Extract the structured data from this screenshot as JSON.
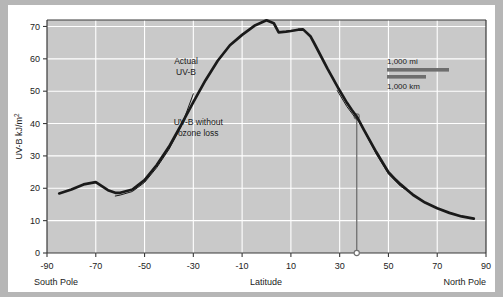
{
  "chart_data": {
    "type": "line",
    "title": "",
    "xlabel": "Latitude",
    "ylabel": "UV-B kJ/m2",
    "ylabel_display": "UV-B kJ/m",
    "ylabel_superscript": "2",
    "xlim": [
      -90,
      90
    ],
    "ylim": [
      0,
      72
    ],
    "grid": true,
    "legend_position": "none",
    "xticks": [
      -90,
      -70,
      -50,
      -30,
      -10,
      10,
      30,
      50,
      70,
      90
    ],
    "xtick_labels": [
      "-90",
      "-70",
      "-50",
      "-30",
      "-10",
      "10",
      "30",
      "50",
      "70",
      "90"
    ],
    "yticks": [
      0,
      10,
      20,
      30,
      40,
      50,
      60,
      70
    ],
    "ytick_labels": [
      "0",
      "10",
      "20",
      "30",
      "40",
      "50",
      "60",
      "70"
    ],
    "axis_end_labels": {
      "left": "South Pole",
      "right": "North Pole"
    },
    "series": [
      {
        "name": "Actual UV-B",
        "style": "thick-dark",
        "color": "#1a1a1a",
        "x": [
          -85,
          -80,
          -75,
          -70,
          -65,
          -62,
          -60,
          -55,
          -50,
          -45,
          -40,
          -35,
          -30,
          -25,
          -20,
          -15,
          -10,
          -5,
          0,
          3,
          5,
          8,
          10,
          13,
          15,
          18,
          20,
          25,
          30,
          33,
          35,
          37,
          40,
          45,
          50,
          53,
          55,
          60,
          65,
          70,
          75,
          80,
          85
        ],
        "y": [
          18.4,
          19.6,
          21.2,
          21.9,
          19.4,
          18.6,
          18.6,
          19.6,
          22.5,
          27.2,
          32.8,
          39.6,
          46.6,
          53.4,
          59.4,
          64.2,
          67.4,
          70.2,
          71.9,
          71.0,
          68.2,
          68.4,
          68.6,
          69.0,
          69.1,
          67.0,
          64.2,
          57.0,
          50.2,
          46.4,
          44.2,
          42.2,
          38.0,
          31.2,
          25.0,
          22.6,
          21.2,
          18.0,
          15.6,
          13.8,
          12.4,
          11.3,
          10.6
        ]
      },
      {
        "name": "UV-B without ozone loss",
        "style": "thin-dark",
        "color": "#1a1a1a",
        "x": [
          -62,
          -60,
          -55,
          -50,
          -45,
          -40,
          -35,
          -30
        ],
        "y": [
          17.6,
          17.9,
          19.0,
          21.8,
          26.4,
          32.0,
          39.0,
          49.2
        ]
      },
      {
        "name": "UV-B without ozone loss (north segment)",
        "style": "thin-dark",
        "color": "#1a1a1a",
        "x": [
          29,
          33,
          36,
          38,
          41,
          45,
          50,
          55,
          58,
          60
        ],
        "y": [
          50.2,
          45.2,
          42.2,
          40.6,
          36.4,
          30.6,
          24.4,
          20.6,
          19.2,
          18.4
        ]
      }
    ],
    "annotations": [
      {
        "name": "actual-uv-b-label",
        "lines": [
          "Actual",
          "UV-B"
        ],
        "x": -33,
        "y": 58.5,
        "align": "middle"
      },
      {
        "name": "uv-b-without-ozone-loss-label",
        "lines": [
          "UV-B without",
          "ozone loss"
        ],
        "x": -28,
        "y": 39.5,
        "align": "middle"
      }
    ],
    "marker_line": {
      "name": "latitude-marker",
      "latitude": 37,
      "top_value": 42.2,
      "bottom_value": 0,
      "color": "#6f6f6f"
    },
    "scale_legend": {
      "name": "distance-scale",
      "top_label": "1,000 mi",
      "bottom_label": "1,000 km",
      "bar_color": "#6e6e6e"
    },
    "colors": {
      "plot_background": "#c9c9c9",
      "grid": "#ffffff",
      "axis": "#3a3a3a",
      "curve": "#1a1a1a",
      "frame": "#b6b6b6",
      "card": "#ffffff"
    }
  }
}
